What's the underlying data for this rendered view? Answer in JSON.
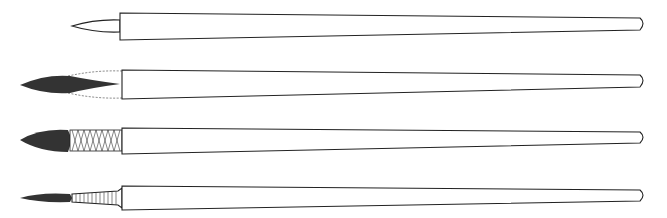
{
  "figure": {
    "brushes": [
      {
        "id": "brush-1",
        "tip": "bare-wooden-point",
        "ferrule": "none",
        "y": 26
      },
      {
        "id": "brush-2",
        "tip": "hair-tuft",
        "ferrule": "quill-bound",
        "y": 80
      },
      {
        "id": "brush-3",
        "tip": "round-full",
        "ferrule": "wire-wrapped",
        "y": 137
      },
      {
        "id": "brush-4",
        "tip": "thin-pointed",
        "ferrule": "ribbed",
        "y": 192
      }
    ],
    "colors": {
      "ink": "#222222",
      "background": "#ffffff"
    }
  }
}
